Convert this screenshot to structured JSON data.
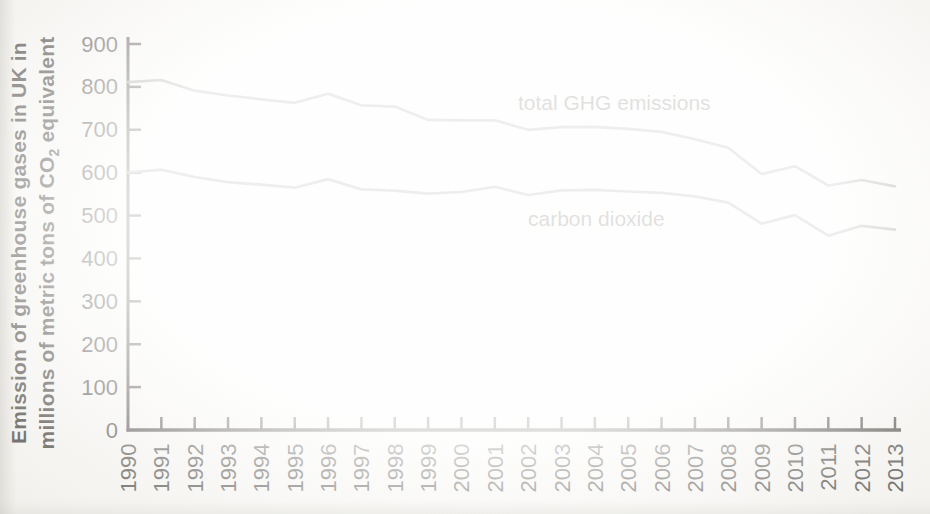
{
  "figure": {
    "background": "#fbfaf7",
    "axis_color": "#2c2a26",
    "tick_label_color": "#2e2c28",
    "annotation_color": "#34312c",
    "line_color": "#8f8f8f"
  },
  "ylabel": {
    "line1": "Emission of greenhouse gases in UK in",
    "line2_pre": "millions of metric tons of CO",
    "line2_sub": "2",
    "line2_post": " equivalent"
  },
  "chart_data": {
    "type": "line",
    "ylabel": "Emission of greenhouse gases in UK in millions of metric tons of CO2 equivalent",
    "xlabel": "",
    "title": "",
    "grid": false,
    "legend_position": "inline-annotations",
    "ylim": [
      0,
      900
    ],
    "y_ticks": [
      0,
      100,
      200,
      300,
      400,
      500,
      600,
      700,
      800,
      900
    ],
    "x": [
      1990,
      1991,
      1992,
      1993,
      1994,
      1995,
      1996,
      1997,
      1998,
      1999,
      2000,
      2001,
      2002,
      2003,
      2004,
      2005,
      2006,
      2007,
      2008,
      2009,
      2010,
      2011,
      2012,
      2013
    ],
    "series": [
      {
        "name": "total GHG emissions",
        "color": "#8f8f8f",
        "values": [
          811,
          816,
          791,
          780,
          771,
          763,
          784,
          757,
          754,
          723,
          722,
          722,
          700,
          706,
          707,
          702,
          695,
          678,
          658,
          597,
          615,
          570,
          583,
          568
        ]
      },
      {
        "name": "carbon dioxide",
        "color": "#8f8f8f",
        "values": [
          600,
          607,
          590,
          578,
          572,
          565,
          585,
          561,
          558,
          551,
          555,
          567,
          548,
          559,
          560,
          556,
          553,
          545,
          530,
          481,
          501,
          453,
          476,
          467
        ]
      }
    ],
    "annotations": [
      {
        "text": "total GHG emissions",
        "px": 518,
        "py": 110
      },
      {
        "text": "carbon dioxide",
        "px": 528,
        "py": 226
      }
    ]
  }
}
